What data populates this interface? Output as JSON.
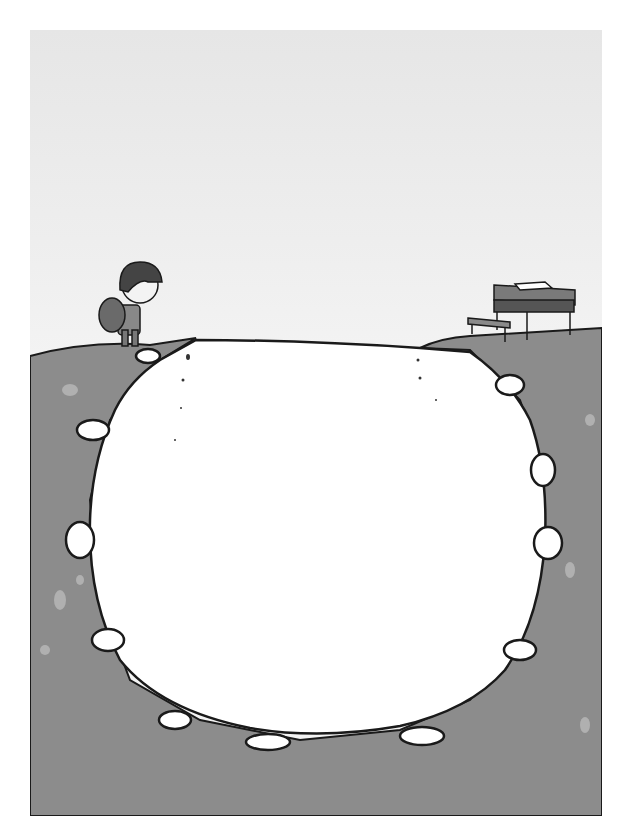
{
  "illustration": {
    "description": "Child with backpack standing on the edge of a cliff, looking across a virus-shaped chasm toward a school desk and bench on the opposite side",
    "elements": [
      "child-with-backpack",
      "virus-shaped-chasm",
      "school-desk",
      "bench",
      "open-books"
    ],
    "colors": {
      "sky_top": "#e6e6e6",
      "sky_mid": "#f6f6f6",
      "ground": "#8a8a8a",
      "ground_light": "#a8a8a8",
      "chasm": "#ffffff",
      "outline": "#1a1a1a"
    },
    "signature": "Sepaz"
  }
}
